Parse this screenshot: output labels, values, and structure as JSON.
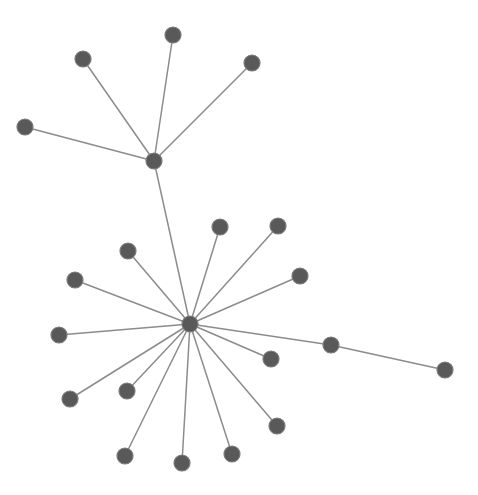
{
  "graph": {
    "type": "network",
    "width": 478,
    "height": 495,
    "colors": {
      "background": "#ffffff",
      "node_fill": "#595959",
      "node_stroke": "#7a7a7a",
      "edge": "#8c8c8c"
    },
    "node_radius": 8,
    "nodes": [
      {
        "id": "hub-top",
        "x": 154,
        "y": 161
      },
      {
        "id": "t1",
        "x": 173,
        "y": 35
      },
      {
        "id": "t2",
        "x": 83,
        "y": 59
      },
      {
        "id": "t3",
        "x": 252,
        "y": 63
      },
      {
        "id": "t4",
        "x": 25,
        "y": 127
      },
      {
        "id": "hub-main",
        "x": 190,
        "y": 324
      },
      {
        "id": "m1",
        "x": 220,
        "y": 227
      },
      {
        "id": "m2",
        "x": 278,
        "y": 226
      },
      {
        "id": "m3",
        "x": 128,
        "y": 251
      },
      {
        "id": "m4",
        "x": 300,
        "y": 276
      },
      {
        "id": "m5",
        "x": 75,
        "y": 280
      },
      {
        "id": "m6",
        "x": 59,
        "y": 335
      },
      {
        "id": "m7",
        "x": 271,
        "y": 359
      },
      {
        "id": "m8",
        "x": 331,
        "y": 345
      },
      {
        "id": "m9",
        "x": 127,
        "y": 391
      },
      {
        "id": "m10",
        "x": 70,
        "y": 399
      },
      {
        "id": "m11",
        "x": 277,
        "y": 426
      },
      {
        "id": "m12",
        "x": 232,
        "y": 454
      },
      {
        "id": "m13",
        "x": 125,
        "y": 456
      },
      {
        "id": "m14",
        "x": 182,
        "y": 463
      },
      {
        "id": "r1",
        "x": 445,
        "y": 370
      }
    ],
    "edges": [
      [
        "hub-top",
        "t1"
      ],
      [
        "hub-top",
        "t2"
      ],
      [
        "hub-top",
        "t3"
      ],
      [
        "hub-top",
        "t4"
      ],
      [
        "hub-top",
        "hub-main"
      ],
      [
        "hub-main",
        "m1"
      ],
      [
        "hub-main",
        "m2"
      ],
      [
        "hub-main",
        "m3"
      ],
      [
        "hub-main",
        "m4"
      ],
      [
        "hub-main",
        "m5"
      ],
      [
        "hub-main",
        "m6"
      ],
      [
        "hub-main",
        "m7"
      ],
      [
        "hub-main",
        "m8"
      ],
      [
        "hub-main",
        "m9"
      ],
      [
        "hub-main",
        "m10"
      ],
      [
        "hub-main",
        "m11"
      ],
      [
        "hub-main",
        "m12"
      ],
      [
        "hub-main",
        "m13"
      ],
      [
        "hub-main",
        "m14"
      ],
      [
        "m8",
        "r1"
      ]
    ]
  }
}
